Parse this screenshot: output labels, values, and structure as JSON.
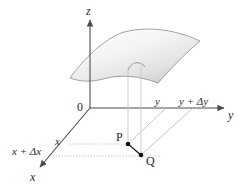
{
  "figure": {
    "background_color": "#ffffff",
    "axis_color": "#4d4d4d",
    "guide_color": "#b0b0b0",
    "dotted_color": "#b8b8b8",
    "surface_edge_color": "#808080",
    "surface_fill_light": "#fdfdfd",
    "surface_fill_dark": "#d8d8d8",
    "point_color": "#1a1a1a"
  },
  "axes": {
    "z_label": "z",
    "y_label": "y",
    "x_label": "x",
    "origin_label": "0"
  },
  "ticks": {
    "y_value": "y",
    "y_increment": "y + Δy",
    "x_value": "x",
    "x_increment": "x + Δx"
  },
  "points": [
    {
      "name": "P",
      "label": "P"
    },
    {
      "name": "Q",
      "label": "Q"
    }
  ],
  "surface": {
    "name": "z = f(x, y) surface patch",
    "arc_label": ""
  }
}
